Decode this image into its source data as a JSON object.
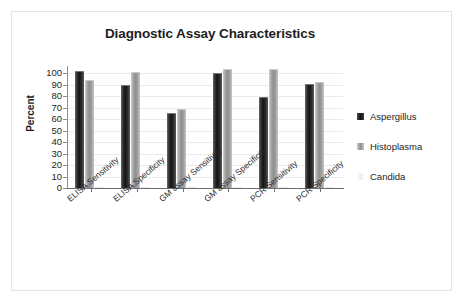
{
  "figure": {
    "frame_color": "#e3e3e3",
    "background": "#ffffff"
  },
  "chart_data": {
    "type": "bar",
    "title": "Diagnostic Assay Characteristics",
    "xlabel": "",
    "ylabel": "Percent",
    "ylim": [
      0,
      100
    ],
    "yticks": [
      0,
      10,
      20,
      30,
      40,
      50,
      60,
      70,
      80,
      90,
      100
    ],
    "grid": true,
    "grid_axis": "y",
    "legend_position": "right",
    "categories": [
      "ELISA Sensitivity",
      "ELISA Specificity",
      "GM assay Sensitivity",
      "GM assay Specificity",
      "PCR Sensitivity",
      "PCR Specificity"
    ],
    "series": [
      {
        "name": "Aspergillus",
        "color": "#141414",
        "values": [
          101,
          89,
          64,
          99,
          78,
          90
        ]
      },
      {
        "name": "Histoplasma",
        "color": "#8f8f8f",
        "values": [
          93,
          100,
          68,
          103,
          103,
          91
        ]
      },
      {
        "name": "Candida",
        "color": "#eeeeee",
        "values": [
          0,
          0,
          0,
          0,
          0,
          0
        ]
      }
    ]
  },
  "axis": {
    "y_title": "Percent",
    "y_labels": [
      "100",
      "90",
      "80",
      "70",
      "60",
      "50",
      "40",
      "30",
      "20",
      "10",
      "0"
    ]
  },
  "legend": {
    "items": [
      {
        "label": "Aspergillus",
        "swatch": "legend-swatch-aspergillus"
      },
      {
        "label": "Histoplasma",
        "swatch": "legend-swatch-histoplasma"
      },
      {
        "label": "Candida",
        "swatch": "legend-swatch-candida"
      }
    ]
  }
}
